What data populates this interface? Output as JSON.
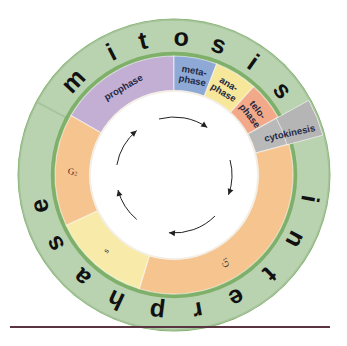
{
  "diagram": {
    "center": [
      174,
      175
    ],
    "outer_ring": {
      "r_outer": 155,
      "r_inner": 122,
      "segments": [
        {
          "id": "mitosis",
          "label": "mitosis",
          "start_deg": -62,
          "end_deg": 68,
          "color": "#b9d2b0"
        },
        {
          "id": "interphase",
          "label": "interphase",
          "start_deg": 68,
          "end_deg": 298,
          "color": "#b9d2b0"
        }
      ],
      "edge_color": "#7fb06a",
      "letters": [
        {
          "char": "m",
          "deg": -47
        },
        {
          "char": "i",
          "deg": -27
        },
        {
          "char": "t",
          "deg": -13
        },
        {
          "char": "o",
          "deg": 3
        },
        {
          "char": "s",
          "deg": 19
        },
        {
          "char": "i",
          "deg": 35
        },
        {
          "char": "s",
          "deg": 52
        },
        {
          "char": "i",
          "deg": 100
        },
        {
          "char": "n",
          "deg": 118
        },
        {
          "char": "t",
          "deg": 136
        },
        {
          "char": "e",
          "deg": 153
        },
        {
          "char": "r",
          "deg": 170
        },
        {
          "char": "p",
          "deg": 187
        },
        {
          "char": "h",
          "deg": 205
        },
        {
          "char": "a",
          "deg": 222
        },
        {
          "char": "s",
          "deg": 240
        },
        {
          "char": "e",
          "deg": 257
        }
      ]
    },
    "inner_ring": {
      "r_outer": 119,
      "r_inner": 84,
      "phases": [
        {
          "id": "prophase",
          "label": "prophase",
          "lines": [
            "prophase"
          ],
          "start_deg": -60,
          "end_deg": 0,
          "color": "#c3aed4",
          "label_deg": -30
        },
        {
          "id": "metaphase",
          "label": "metaphase",
          "lines": [
            "meta-",
            "phase"
          ],
          "start_deg": 0,
          "end_deg": 21,
          "color": "#8fa9d6",
          "label_deg": 11
        },
        {
          "id": "anaphase",
          "label": "anaphase",
          "lines": [
            "ana-",
            "phase"
          ],
          "start_deg": 21,
          "end_deg": 42,
          "color": "#f7e79a",
          "label_deg": 31
        },
        {
          "id": "telophase",
          "label": "telophase",
          "lines": [
            "telo-",
            "phase"
          ],
          "start_deg": 42,
          "end_deg": 61,
          "color": "#f2a98a",
          "label_deg": 52
        },
        {
          "id": "cytokinesis",
          "label": "cytokinesis",
          "lines": [
            "cytokinesis"
          ],
          "start_deg": 61,
          "end_deg": 75,
          "color": "#b9b9b9",
          "label_deg": 70
        },
        {
          "id": "g1",
          "label": "G1",
          "lines": [
            "G1"
          ],
          "start_deg": 75,
          "end_deg": 197,
          "color": "#f6c48e",
          "label_deg": 150
        },
        {
          "id": "s",
          "label": "S",
          "lines": [
            "S"
          ],
          "start_deg": 197,
          "end_deg": 245,
          "color": "#f8ebaa",
          "label_deg": 222
        },
        {
          "id": "g2",
          "label": "G2",
          "lines": [
            "G2"
          ],
          "start_deg": 245,
          "end_deg": 300,
          "color": "#f6c48e",
          "label_deg": 272
        }
      ]
    },
    "cytokinesis_outer_box": {
      "label": "cytokinesis",
      "color": "#b5b5b5"
    },
    "cycle_arrows": {
      "radius": 58,
      "direction": "clockwise",
      "arcs": [
        {
          "start_deg": -15,
          "end_deg": 35
        },
        {
          "start_deg": 75,
          "end_deg": 110
        },
        {
          "start_deg": 135,
          "end_deg": 185
        },
        {
          "start_deg": 220,
          "end_deg": 255
        },
        {
          "start_deg": 280,
          "end_deg": 320
        }
      ],
      "color": "#222222"
    },
    "divider_color": "#5a3440"
  }
}
